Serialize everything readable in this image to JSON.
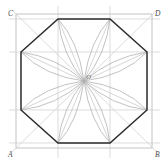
{
  "figure": {
    "canvas": {
      "width": 168,
      "height": 163,
      "background": "#ffffff"
    },
    "colors": {
      "octagon_stroke": "#2b2b2b",
      "square_stroke": "#b9b9b9",
      "construction_stroke": "#c9c9c9",
      "arc_stroke": "#a8a8a8",
      "diagonal_stroke": "#cfcfcf",
      "label_color": "#4a4a4a",
      "center_label_color": "#6a6a6a"
    },
    "labels": {
      "bottom_left": "A",
      "bottom_right": "B",
      "top_left": "C",
      "top_right": "D",
      "center": "O"
    },
    "label_positions": {
      "bottom_left": {
        "x": 10,
        "y": 155
      },
      "bottom_right": {
        "x": 155,
        "y": 155
      },
      "top_left": {
        "x": 10,
        "y": 16
      },
      "top_right": {
        "x": 155,
        "y": 16
      },
      "center": {
        "x": 86,
        "y": 78
      }
    },
    "square": {
      "left": 16,
      "top": 14,
      "right": 152,
      "bottom": 148,
      "corners": [
        {
          "name": "A",
          "x": 16,
          "y": 148
        },
        {
          "name": "B",
          "x": 152,
          "y": 148
        },
        {
          "name": "D",
          "x": 152,
          "y": 14
        },
        {
          "name": "C",
          "x": 16,
          "y": 14
        }
      ]
    },
    "octagon": {
      "vertices": [
        {
          "x": 58,
          "y": 19
        },
        {
          "x": 110,
          "y": 19
        },
        {
          "x": 147,
          "y": 52
        },
        {
          "x": 147,
          "y": 110
        },
        {
          "x": 110,
          "y": 143
        },
        {
          "x": 58,
          "y": 143
        },
        {
          "x": 21,
          "y": 110
        },
        {
          "x": 21,
          "y": 52
        }
      ]
    },
    "center_point": {
      "x": 84,
      "y": 81
    },
    "construction_lines": {
      "horizontals_y": [
        19,
        52,
        110,
        143
      ],
      "verticals_x": [
        58,
        110
      ],
      "diagonals": [
        {
          "x1": 16,
          "y1": 14,
          "x2": 152,
          "y2": 148
        },
        {
          "x1": 152,
          "y1": 14,
          "x2": 16,
          "y2": 148
        }
      ]
    },
    "arc_count": 8,
    "arc_description": "eight arcs sweeping from square side midpoints and octagon vertices converging at center O"
  }
}
